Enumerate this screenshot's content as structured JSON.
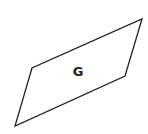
{
  "diagram": {
    "shape": "parallelogram",
    "label": "G",
    "stroke_color": "#222222",
    "fill_color": "#ffffff",
    "vertices": [
      [
        142,
        19
      ],
      [
        125,
        76
      ],
      [
        15,
        126
      ],
      [
        32,
        68
      ]
    ]
  }
}
